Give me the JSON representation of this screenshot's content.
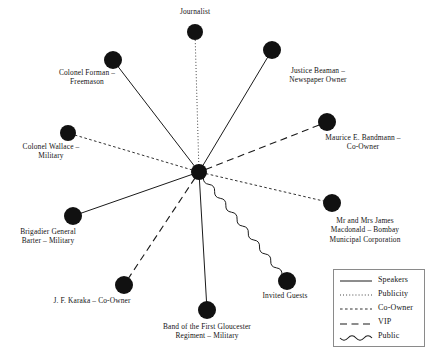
{
  "figure": {
    "type": "network-diagram",
    "background_color": "#ffffff",
    "node_color": "#111111",
    "line_color": "#1a1a1a",
    "width": 429,
    "height": 353
  },
  "hub": {
    "name": "hub",
    "label": "",
    "x": 199,
    "y": 172,
    "r": 8
  },
  "nodes": [
    {
      "id": "journalist",
      "label": "Journalist",
      "x": 195,
      "y": 32,
      "r": 8,
      "relation": "Publicity",
      "line_style": "dotted",
      "label_x": 195,
      "label_y": 7,
      "label_width": 120
    },
    {
      "id": "colonel-forman",
      "label": "Colonel Forman –\nFreemason",
      "x": 113,
      "y": 60,
      "r": 9,
      "relation": "Speakers",
      "line_style": "solid",
      "label_x": 87,
      "label_y": 68,
      "label_width": 110
    },
    {
      "id": "justice-beaman",
      "label": "Justice Beaman –\nNewspaper Owner",
      "x": 272,
      "y": 50,
      "r": 9,
      "relation": "Speakers",
      "line_style": "solid",
      "label_x": 318,
      "label_y": 66,
      "label_width": 120
    },
    {
      "id": "colonel-wallace",
      "label": "Colonel Wallace –\nMilitary",
      "x": 68,
      "y": 133,
      "r": 8,
      "relation": "Co-Owner",
      "line_style": "dashed-fine",
      "label_x": 51,
      "label_y": 142,
      "label_width": 105
    },
    {
      "id": "maurice-bandmann",
      "label": "Maurice E. Bandmann –\nCo-Owner",
      "x": 327,
      "y": 122,
      "r": 9,
      "relation": "VIP",
      "line_style": "dashed-long",
      "label_x": 363,
      "label_y": 133,
      "label_width": 132
    },
    {
      "id": "brigadier-barter",
      "label": "Brigadier General\nBarter – Military",
      "x": 73,
      "y": 216,
      "r": 9,
      "relation": "Speakers",
      "line_style": "solid",
      "label_x": 48,
      "label_y": 227,
      "label_width": 105
    },
    {
      "id": "james-macdonald",
      "label": "Mr and Mrs James\nMacdonald – Bombay\nMunicipal Corporation",
      "x": 332,
      "y": 203,
      "r": 9,
      "relation": "Co-Owner",
      "line_style": "dashed-fine",
      "label_x": 365,
      "label_y": 216,
      "label_width": 128
    },
    {
      "id": "jf-karaka",
      "label": "J. F. Karaka – Co-Owner",
      "x": 124,
      "y": 285,
      "r": 9,
      "relation": "VIP",
      "line_style": "dashed-long",
      "label_x": 92,
      "label_y": 296,
      "label_width": 150
    },
    {
      "id": "gloucester-band",
      "label": "Band of the First Gloucester\nRegiment – Military",
      "x": 207,
      "y": 310,
      "r": 9,
      "relation": "Speakers",
      "line_style": "solid",
      "label_x": 207,
      "label_y": 322,
      "label_width": 160
    },
    {
      "id": "invited-guests",
      "label": "Invited Guests",
      "x": 287,
      "y": 281,
      "r": 9,
      "relation": "Public",
      "line_style": "wavy",
      "label_x": 285,
      "label_y": 291,
      "label_width": 110
    }
  ],
  "legend": {
    "x": 333,
    "y": 269,
    "width": 92,
    "height": 78,
    "entries": [
      {
        "label": "Speakers",
        "style": "solid"
      },
      {
        "label": "Publicity",
        "style": "dotted"
      },
      {
        "label": "Co-Owner",
        "style": "dashed-fine"
      },
      {
        "label": "VIP",
        "style": "dashed-long"
      },
      {
        "label": "Public",
        "style": "wavy"
      }
    ]
  }
}
